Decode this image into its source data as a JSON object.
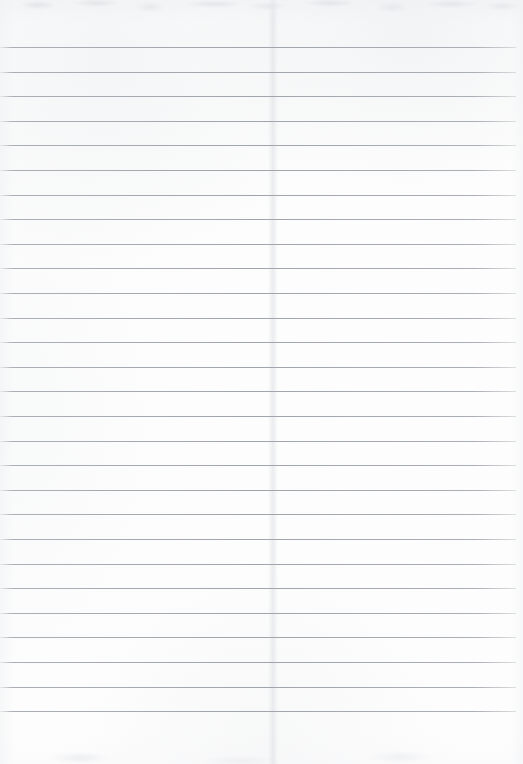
{
  "document": {
    "type": "scanned-ruled-paper",
    "title": "Blank Ruled Notebook Page",
    "description": "A scanned blank sheet of wide-ruled lined paper with no handwriting or printed text.",
    "page_width": 523,
    "page_height": 764,
    "orientation": "portrait",
    "has_text_content": false,
    "has_margin_rule": false,
    "has_holes": false
  },
  "colors": {
    "paper": "#fdfdfd",
    "paper_shade": "#f7f8f9",
    "rule_line": "#a0a5ab",
    "rule_line_fade": "#b0b5ba",
    "grain": "#c4c8cc",
    "fold": "#dee1e5"
  },
  "ruling": {
    "line_count": 28,
    "first_line_y": 47,
    "line_spacing": 24.6,
    "line_thickness": 1,
    "left_inset": 0,
    "right_inset": 7,
    "top_margin_label": "47px blank header area",
    "bottom_margin_label": "49px blank footer area",
    "line_y_positions": [
      47,
      71.6,
      96.2,
      120.8,
      145.4,
      170,
      194.6,
      219.2,
      243.8,
      268.4,
      293,
      317.6,
      342.2,
      366.8,
      391.4,
      416,
      440.6,
      465.2,
      489.8,
      514.4,
      539,
      563.6,
      588.2,
      612.8,
      637.4,
      662,
      686.6,
      711.2
    ]
  },
  "artifacts": {
    "top_grain": {
      "label": "scanner grain band along top edge",
      "y": 0,
      "height": 26
    },
    "bottom_grain": {
      "label": "faint tone band along bottom edge",
      "y": 724,
      "height": 40
    },
    "fold_crease": {
      "label": "faint vertical fold crease",
      "x": 268,
      "width": 10
    }
  }
}
